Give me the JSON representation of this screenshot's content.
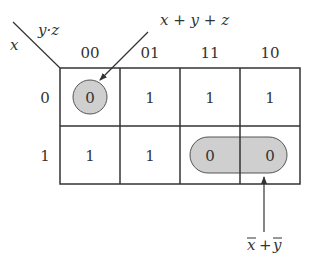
{
  "kmap": {
    "row_var": "x",
    "col_var": "y·z",
    "col_headers": [
      "00",
      "01",
      "11",
      "10"
    ],
    "row_headers": [
      "0",
      "1"
    ],
    "cells": [
      [
        "0",
        "1",
        "1",
        "1"
      ],
      [
        "1",
        "1",
        "0",
        "0"
      ]
    ]
  },
  "annotations": {
    "top_label": "x + y + z",
    "bottom_label_x": "x",
    "bottom_label_plus": "+",
    "bottom_label_y": "y"
  },
  "colors": {
    "grid": "#333333",
    "group_fill": "#cfcfcf",
    "group_stroke": "#555555"
  }
}
